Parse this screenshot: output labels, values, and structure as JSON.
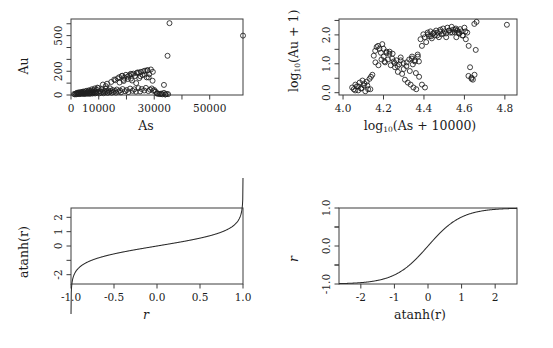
{
  "figure": {
    "clipped_header_text": "",
    "background": "#ffffff",
    "point_color": "#1f1f1f",
    "line_color": "#2b2b2b",
    "axis_color": "#3c3c3c"
  },
  "panels": {
    "tl": {
      "name": "As vs Au scatter",
      "xlabel": "As",
      "ylabel": "Au",
      "xticks": [
        "0",
        "10000",
        "",
        "30000",
        "",
        "50000"
      ],
      "yticks": [
        "0",
        "200",
        "500"
      ]
    },
    "tr": {
      "name": "log10 As vs log10 Au scatter",
      "xlabel_main": "log",
      "xlabel_sub": "10",
      "xlabel_rest": "(As + 10000)",
      "ylabel_main": "log",
      "ylabel_sub": "10",
      "ylabel_rest": "(Au + 1)",
      "xticks": [
        "4.0",
        "4.2",
        "4.4",
        "4.6",
        "4.8"
      ],
      "yticks": [
        "0.0",
        "1.0",
        "2.0"
      ]
    },
    "bl": {
      "name": "atanh transform curve",
      "xlabel": "r",
      "ylabel": "atanh(r)",
      "xticks": [
        "-1.0",
        "-0.5",
        "0.0",
        "0.5",
        "1.0"
      ],
      "yticks": [
        "-2",
        "0",
        "1",
        "2"
      ]
    },
    "br": {
      "name": "tanh inverse transform curve",
      "xlabel": "atanh(r)",
      "ylabel": "r",
      "xticks": [
        "-2",
        "-1",
        "0",
        "1",
        "2"
      ],
      "yticks": [
        "-1.0",
        "0.0",
        "1.0"
      ]
    }
  },
  "chart_data": [
    {
      "type": "scatter",
      "id": "as-au",
      "title": "",
      "xlabel": "As",
      "ylabel": "Au",
      "xlim": [
        0,
        62000
      ],
      "ylim": [
        0,
        640
      ],
      "grid": false,
      "legend": null,
      "xticks": [
        0,
        10000,
        20000,
        30000,
        40000,
        50000
      ],
      "xticklabels": [
        "0",
        "10000",
        "",
        "30000",
        "",
        "50000"
      ],
      "yticks": [
        0,
        200,
        500
      ],
      "yticklabels": [
        "0",
        "200",
        "500"
      ],
      "x": [
        1100,
        1400,
        1700,
        1900,
        2100,
        2300,
        2500,
        2700,
        2900,
        3100,
        3300,
        3500,
        3700,
        3900,
        4100,
        4300,
        4500,
        4700,
        4900,
        5100,
        5300,
        5500,
        5700,
        5900,
        6100,
        6300,
        6500,
        6700,
        6900,
        7100,
        7300,
        7500,
        7700,
        7900,
        8100,
        8300,
        8500,
        8700,
        8900,
        9100,
        9300,
        9600,
        9900,
        10200,
        10500,
        10800,
        11100,
        11400,
        11700,
        12000,
        12300,
        12600,
        12900,
        13200,
        13500,
        13800,
        14100,
        14400,
        14700,
        15000,
        15300,
        15600,
        15900,
        16200,
        16500,
        16800,
        17100,
        17400,
        17700,
        18000,
        18300,
        18600,
        18900,
        19200,
        19500,
        19800,
        20100,
        20400,
        20700,
        21000,
        21300,
        21600,
        21900,
        22200,
        22500,
        22800,
        23100,
        23400,
        23700,
        24000,
        24300,
        24600,
        24900,
        25200,
        25500,
        25800,
        26100,
        26400,
        26700,
        27000,
        27300,
        27600,
        27900,
        28200,
        28500,
        28800,
        29100,
        29400,
        29700,
        30000,
        30500,
        31000,
        31500,
        32000,
        32500,
        33000,
        33500,
        34000,
        34500,
        35000,
        13000,
        14500,
        16000,
        17500,
        19000,
        20500,
        22000,
        23500,
        25000,
        26500,
        28000,
        29500,
        31000,
        32500,
        34000,
        21500,
        24500,
        27500,
        18500,
        11500,
        12500,
        9500,
        8500,
        7500,
        6500,
        5500,
        4500,
        3500,
        2500,
        35500,
        62000,
        34800,
        33500
      ],
      "y": [
        8,
        5,
        12,
        6,
        18,
        9,
        14,
        22,
        7,
        16,
        11,
        25,
        9,
        19,
        13,
        28,
        15,
        8,
        21,
        12,
        30,
        17,
        10,
        24,
        14,
        33,
        19,
        9,
        26,
        15,
        36,
        21,
        12,
        28,
        17,
        40,
        23,
        13,
        30,
        18,
        44,
        25,
        58,
        14,
        32,
        20,
        48,
        27,
        15,
        35,
        22,
        52,
        30,
        17,
        38,
        24,
        56,
        33,
        19,
        42,
        26,
        130,
        35,
        20,
        46,
        140,
        29,
        150,
        38,
        22,
        160,
        50,
        128,
        145,
        32,
        170,
        42,
        155,
        25,
        165,
        54,
        138,
        175,
        35,
        180,
        48,
        160,
        28,
        185,
        190,
        58,
        142,
        30,
        195,
        50,
        168,
        200,
        38,
        205,
        60,
        148,
        210,
        33,
        175,
        45,
        215,
        55,
        120,
        36,
        42,
        28,
        15,
        10,
        8,
        12,
        6,
        18,
        5,
        9,
        7,
        95,
        110,
        125,
        105,
        118,
        135,
        122,
        100,
        158,
        172,
        148,
        195,
        12,
        8,
        5,
        178,
        188,
        205,
        162,
        88,
        75,
        62,
        55,
        48,
        40,
        35,
        28,
        20,
        15,
        605,
        500,
        330,
        85
      ]
    },
    {
      "type": "scatter",
      "id": "log-as-au",
      "title": "",
      "xlabel": "log10(As + 10000)",
      "ylabel": "log10(Au + 1)",
      "xlim": [
        3.98,
        4.86
      ],
      "ylim": [
        -0.08,
        2.55
      ],
      "grid": false,
      "legend": null,
      "xticks": [
        4.0,
        4.2,
        4.4,
        4.6,
        4.8
      ],
      "xticklabels": [
        "4.0",
        "4.2",
        "4.4",
        "4.6",
        "4.8"
      ],
      "yticks": [
        0.0,
        1.0,
        2.0
      ],
      "yticklabels": [
        "0.0",
        "1.0",
        "2.0"
      ],
      "x": [
        4.045,
        4.053,
        4.061,
        4.068,
        4.075,
        4.082,
        4.089,
        4.096,
        4.103,
        4.11,
        4.117,
        4.124,
        4.131,
        4.138,
        4.145,
        4.152,
        4.159,
        4.166,
        4.173,
        4.18,
        4.187,
        4.194,
        4.201,
        4.208,
        4.215,
        4.222,
        4.229,
        4.236,
        4.243,
        4.25,
        4.257,
        4.264,
        4.271,
        4.278,
        4.285,
        4.292,
        4.299,
        4.306,
        4.313,
        4.32,
        4.327,
        4.334,
        4.341,
        4.348,
        4.355,
        4.362,
        4.369,
        4.376,
        4.383,
        4.39,
        4.397,
        4.404,
        4.411,
        4.418,
        4.425,
        4.432,
        4.439,
        4.446,
        4.453,
        4.46,
        4.467,
        4.474,
        4.481,
        4.488,
        4.495,
        4.502,
        4.509,
        4.516,
        4.523,
        4.53,
        4.537,
        4.544,
        4.551,
        4.558,
        4.565,
        4.572,
        4.579,
        4.586,
        4.593,
        4.6,
        4.607,
        4.614,
        4.621,
        4.628,
        4.635,
        4.642,
        4.649,
        4.656,
        4.2,
        4.215,
        4.23,
        4.245,
        4.34,
        4.355,
        4.37,
        4.42,
        4.435,
        4.45,
        4.465,
        4.48,
        4.495,
        4.51,
        4.525,
        4.54,
        4.555,
        4.57,
        4.16,
        4.175,
        4.19,
        4.205,
        4.255,
        4.27,
        4.285,
        4.3,
        4.315,
        4.33,
        4.345,
        4.36,
        4.375,
        4.39,
        4.405,
        4.62,
        4.635,
        4.65,
        4.56,
        4.575,
        4.59,
        4.605,
        4.06,
        4.075,
        4.09,
        4.105,
        4.12,
        4.135,
        4.81,
        4.66
      ],
      "y": [
        0.18,
        0.12,
        0.28,
        0.22,
        0.08,
        0.35,
        0.15,
        0.42,
        0.25,
        0.05,
        0.38,
        0.12,
        0.48,
        0.55,
        0.62,
        1.28,
        1.45,
        1.58,
        1.62,
        1.52,
        1.38,
        1.68,
        1.25,
        1.05,
        1.42,
        1.15,
        1.35,
        0.95,
        1.18,
        1.08,
        0.88,
        1.12,
        0.72,
        0.98,
        1.22,
        0.65,
        1.02,
        0.45,
        0.92,
        0.35,
        1.15,
        0.28,
        1.25,
        0.18,
        1.08,
        0.12,
        1.32,
        0.55,
        1.85,
        1.62,
        2.02,
        1.92,
        1.75,
        2.08,
        1.95,
        2.12,
        1.88,
        2.05,
        1.98,
        2.15,
        2.08,
        1.92,
        2.18,
        2.02,
        2.22,
        2.12,
        2.05,
        2.25,
        2.15,
        2.08,
        2.28,
        2.18,
        2.1,
        2.22,
        2.15,
        2.05,
        2.2,
        2.12,
        1.98,
        2.25,
        1.85,
        2.08,
        1.62,
        0.88,
        0.52,
        0.45,
        2.38,
        1.48,
        1.52,
        1.38,
        1.42,
        1.35,
        1.18,
        1.12,
        1.25,
        2.02,
        1.95,
        2.08,
        1.98,
        2.12,
        2.05,
        1.92,
        2.15,
        2.08,
        2.18,
        2.1,
        1.05,
        0.95,
        1.15,
        1.08,
        1.02,
        0.92,
        1.12,
        0.82,
        1.05,
        0.75,
        0.98,
        0.68,
        1.08,
        0.28,
        0.18,
        0.58,
        0.48,
        0.62,
        1.92,
        2.05,
        1.98,
        2.12,
        0.08,
        0.22,
        0.15,
        0.32,
        0.25,
        0.12,
        2.35,
        2.45
      ]
    },
    {
      "type": "line",
      "id": "atanh",
      "title": "",
      "xlabel": "r",
      "ylabel": "atanh(r)",
      "function": "atanh(x)",
      "xlim": [
        -1.0,
        1.0
      ],
      "ylim": [
        -2.65,
        2.65
      ],
      "grid": false,
      "legend": null,
      "xticks": [
        -1.0,
        -0.5,
        0.0,
        0.5,
        1.0
      ],
      "xticklabels": [
        "-1.0",
        "-0.5",
        "0.0",
        "0.5",
        "1.0"
      ],
      "yticks": [
        -2,
        -1,
        0,
        1,
        2
      ],
      "yticklabels": [
        "-2",
        "",
        "0",
        "1",
        "2"
      ]
    },
    {
      "type": "line",
      "id": "tanh",
      "title": "",
      "xlabel": "atanh(r)",
      "ylabel": "r",
      "function": "tanh(x)",
      "xlim": [
        -2.65,
        2.65
      ],
      "ylim": [
        -1.0,
        1.0
      ],
      "grid": false,
      "legend": null,
      "xticks": [
        -2,
        -1,
        0,
        1,
        2
      ],
      "xticklabels": [
        "-2",
        "-1",
        "0",
        "1",
        "2"
      ],
      "yticks": [
        -1.0,
        -0.5,
        0.0,
        0.5,
        1.0
      ],
      "yticklabels": [
        "-1.0",
        "",
        "0.0",
        "",
        "1.0"
      ]
    }
  ]
}
